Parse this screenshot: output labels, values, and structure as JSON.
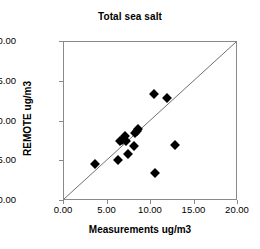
{
  "chart_data": {
    "type": "scatter",
    "title": "Total sea salt",
    "xlabel": "Measurements ug/m3",
    "ylabel": "REMOTE ug/m3",
    "xlim": [
      0,
      20
    ],
    "ylim": [
      0,
      20
    ],
    "grid": false,
    "legend": null,
    "xticks": [
      "0.00",
      "5.00",
      "10.00",
      "15.00",
      "20.00"
    ],
    "yticks": [
      "0.00",
      "5.00",
      "10.00",
      "15.00",
      "20.00"
    ],
    "xtick_values": [
      0,
      5,
      10,
      15,
      20
    ],
    "ytick_values": [
      0,
      5,
      10,
      15,
      20
    ],
    "marker": "filled-diamond",
    "marker_color": "#000000",
    "reference_line": {
      "name": "one-to-one-line",
      "from": [
        0,
        0
      ],
      "to": [
        20,
        20
      ],
      "color": "#6e6e6e"
    },
    "points": [
      {
        "x": 3.6,
        "y": 4.6
      },
      {
        "x": 6.2,
        "y": 5.1
      },
      {
        "x": 6.4,
        "y": 7.6
      },
      {
        "x": 6.7,
        "y": 7.7
      },
      {
        "x": 7.0,
        "y": 8.2
      },
      {
        "x": 7.1,
        "y": 7.5
      },
      {
        "x": 7.3,
        "y": 5.9
      },
      {
        "x": 8.0,
        "y": 6.9
      },
      {
        "x": 8.2,
        "y": 8.6
      },
      {
        "x": 8.4,
        "y": 8.8
      },
      {
        "x": 8.5,
        "y": 9.1
      },
      {
        "x": 10.4,
        "y": 13.4
      },
      {
        "x": 10.5,
        "y": 3.5
      },
      {
        "x": 11.8,
        "y": 12.9
      },
      {
        "x": 12.8,
        "y": 7.0
      }
    ]
  }
}
